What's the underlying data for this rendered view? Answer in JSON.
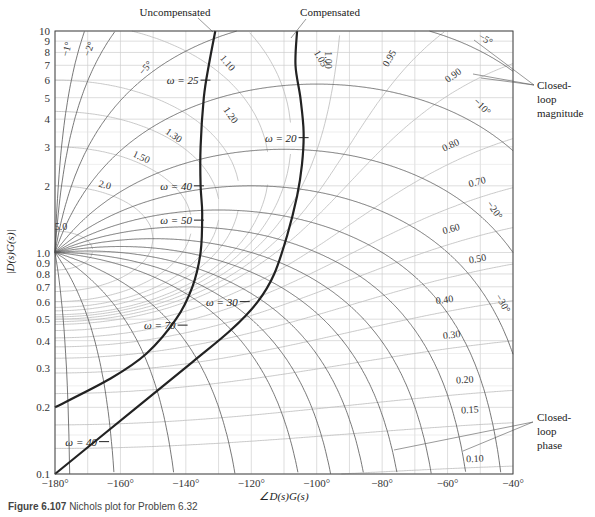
{
  "figure": {
    "caption_label": "Figure 6.107",
    "caption_text": "Nichols plot for Problem 6.32"
  },
  "chart_data": {
    "type": "line",
    "title": "Nichols plot",
    "xlabel": "∠D(s)G(s)",
    "ylabel": "|D(s)G(s)|",
    "xlim": [
      -180,
      -40
    ],
    "ylim": [
      0.1,
      10
    ],
    "yscale": "log",
    "grid": true,
    "x_ticks": [
      "−180°",
      "−160°",
      "−140°",
      "−120°",
      "−100°",
      "−80°",
      "−60°",
      "−40°"
    ],
    "x_tick_values": [
      -180,
      -160,
      -140,
      -120,
      -100,
      -80,
      -60,
      -40
    ],
    "y_ticks": [
      "10",
      "9",
      "8",
      "7",
      "6",
      "5",
      "4",
      "3",
      "2",
      "1.0",
      "0.9",
      "0.8",
      "0.7",
      "0.6",
      "0.5",
      "0.4",
      "0.3",
      "0.2",
      "0.1"
    ],
    "y_tick_values": [
      10,
      9,
      8,
      7,
      6,
      5,
      4,
      3,
      2,
      1.0,
      0.9,
      0.8,
      0.7,
      0.6,
      0.5,
      0.4,
      0.3,
      0.2,
      0.1
    ],
    "series": [
      {
        "name": "Uncompensated",
        "points": [
          [
            -131,
            10
          ],
          [
            -133,
            7
          ],
          [
            -134.5,
            5
          ],
          [
            -135.5,
            3
          ],
          [
            -135.5,
            2
          ],
          [
            -135,
            1.5
          ],
          [
            -135.5,
            1.0
          ],
          [
            -138,
            0.7
          ],
          [
            -143,
            0.5
          ],
          [
            -152,
            0.35
          ],
          [
            -163,
            0.27
          ],
          [
            -180,
            0.2
          ]
        ],
        "frequency_markers": [
          {
            "label": "ω = 25",
            "phase": -134,
            "mag": 6
          },
          {
            "label": "ω = 40",
            "phase": -136,
            "mag": 2
          },
          {
            "label": "ω = 50",
            "phase": -136,
            "mag": 1.4
          },
          {
            "label": "ω = 70",
            "phase": -141,
            "mag": 0.47
          }
        ]
      },
      {
        "name": "Compensated",
        "points": [
          [
            -106,
            10
          ],
          [
            -106.5,
            7
          ],
          [
            -105,
            5
          ],
          [
            -104,
            3.5
          ],
          [
            -104.5,
            2.5
          ],
          [
            -106,
            1.8
          ],
          [
            -109,
            1.2
          ],
          [
            -113,
            0.8
          ],
          [
            -118,
            0.6
          ],
          [
            -126,
            0.45
          ],
          [
            -138,
            0.32
          ],
          [
            -155,
            0.2
          ],
          [
            -180,
            0.1
          ]
        ],
        "frequency_markers": [
          {
            "label": "ω = 20",
            "phase": -104,
            "mag": 3.3
          },
          {
            "label": "ω = 30",
            "phase": -122,
            "mag": 0.6
          },
          {
            "label": "ω = 40",
            "phase": -165,
            "mag": 0.14
          }
        ]
      }
    ],
    "closed_loop_magnitude_contours": [
      "1.05",
      "1.10",
      "1.20",
      "1.30",
      "1.50",
      "2.0",
      "5.0",
      "1.00",
      "0.95",
      "0.90",
      "0.80",
      "0.70",
      "0.60",
      "0.50",
      "0.40",
      "0.30",
      "0.20",
      "0.15",
      "0.10"
    ],
    "closed_loop_phase_contours": [
      "−1°",
      "−2°",
      "−5°",
      "−10°",
      "−20°",
      "−30°"
    ],
    "annotations": [
      "Uncompensated",
      "Compensated",
      "Closed-loop magnitude",
      "Closed-loop phase"
    ]
  },
  "labels": {
    "uncompensated": "Uncompensated",
    "compensated": "Compensated",
    "cl_mag_1": "Closed-",
    "cl_mag_2": "loop",
    "cl_mag_3": "magnitude",
    "cl_phase_1": "Closed-",
    "cl_phase_2": "loop",
    "cl_phase_3": "phase",
    "xlabel": "∠D(s)G(s)",
    "ylabel": "|D(s)G(s)|"
  },
  "colors": {
    "curve": "#222222",
    "contour_mag": "#bbbbbb",
    "contour_phase": "#555555",
    "grid": "#cfcfcf"
  }
}
